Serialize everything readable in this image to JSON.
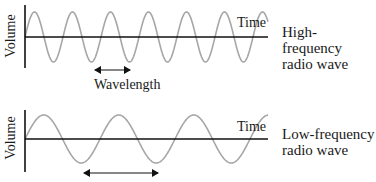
{
  "colors": {
    "axis": "#111111",
    "wave": "#a6a6a6",
    "text": "#1a1a1a",
    "background": "#ffffff"
  },
  "panels": [
    {
      "id": "high",
      "y_axis_label": "Volume",
      "x_axis_label": "Time",
      "caption_line1": "High-frequency",
      "caption_line2": "radio wave",
      "wavelength_label": "Wavelength",
      "wave": {
        "axis_y": 37,
        "amplitude": 25,
        "period": 38,
        "x_start": 25,
        "x_end": 268
      }
    },
    {
      "id": "low",
      "y_axis_label": "Volume",
      "x_axis_label": "Time",
      "caption_line1": "Low-frequency",
      "caption_line2": "radio wave",
      "wave": {
        "axis_y": 139,
        "amplitude": 24,
        "period": 75,
        "x_start": 25,
        "x_end": 268
      }
    }
  ]
}
